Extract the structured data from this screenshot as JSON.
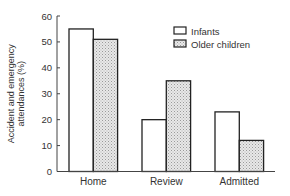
{
  "chart_data": {
    "type": "bar",
    "title": "",
    "xlabel": "",
    "ylabel": "Accident and emergency attendances (%)",
    "ylabel_lines": [
      "Accident and emergency",
      "attendances (%)"
    ],
    "categories": [
      "Home",
      "Review",
      "Admitted"
    ],
    "series": [
      {
        "name": "Infants",
        "values": [
          55,
          20,
          23
        ],
        "fill": "#ffffff",
        "pattern": "none"
      },
      {
        "name": "Older children",
        "values": [
          51,
          35,
          12
        ],
        "fill": "#d9d9d9",
        "pattern": "stipple"
      }
    ],
    "ylim": [
      0,
      60
    ],
    "yticks": [
      0,
      10,
      20,
      30,
      40,
      50,
      60
    ],
    "grid": false,
    "legend_position": "upper right"
  },
  "legend": {
    "items": [
      {
        "label": "Infants"
      },
      {
        "label": "Older children"
      }
    ]
  },
  "colors": {
    "axis": "#444444",
    "bar_outline": "#222222",
    "text": "#333333",
    "stipple_bg": "#e8e8e8",
    "stipple_dot": "#9a9a9a"
  }
}
